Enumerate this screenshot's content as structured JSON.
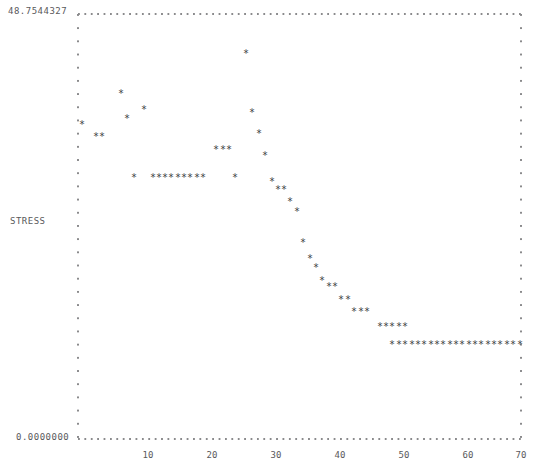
{
  "chart_data": {
    "type": "scatter",
    "title": "",
    "xlabel": "",
    "ylabel": "STRESS",
    "marker": "*",
    "grid": false,
    "legend": null,
    "xlim": [
      0,
      70
    ],
    "ylim": [
      0.0,
      48.7544327
    ],
    "y_axis_top_label": "48.7544327",
    "y_axis_bottom_label": "0.0000000",
    "x_tick_labels": [
      "10",
      "20",
      "30",
      "40",
      "50",
      "60",
      "70"
    ],
    "x_tick_values": [
      10,
      20,
      30,
      40,
      50,
      60,
      70
    ],
    "x": [
      1,
      3,
      4,
      7,
      8,
      10,
      11,
      13,
      14,
      15,
      16,
      17,
      18,
      19,
      20,
      21,
      22,
      23,
      24,
      25,
      26,
      27,
      28,
      29,
      30,
      31,
      32,
      33,
      34,
      35,
      36,
      37,
      38,
      39,
      40,
      41,
      42,
      43,
      44,
      45,
      46,
      47,
      48,
      49,
      50,
      51,
      52,
      53,
      54,
      55,
      56,
      57,
      58,
      59,
      60,
      61,
      62,
      63,
      64,
      65,
      66,
      67,
      68,
      69,
      70
    ],
    "y": [
      33.5,
      31.0,
      31.0,
      38.5,
      34.5,
      28.0,
      25.5,
      25.5,
      25.5,
      25.5,
      25.5,
      25.5,
      25.5,
      25.5,
      25.5,
      25.5,
      29.0,
      29.0,
      29.0,
      44.5,
      36.0,
      31.5,
      25.5,
      27.5,
      24.5,
      23.5,
      22.0,
      19.5,
      17.0,
      15.5,
      14.0,
      14.0,
      12.0,
      12.0,
      10.5,
      10.5,
      10.5,
      9.0,
      9.0,
      9.0,
      7.5,
      7.5,
      7.5,
      7.5,
      7.5,
      6.0,
      6.0,
      6.0,
      6.0,
      6.0,
      6.0,
      6.0,
      6.0,
      6.0,
      6.0,
      6.0,
      6.0,
      6.0,
      6.0,
      6.0,
      6.0,
      6.0,
      6.0,
      6.0,
      6.0
    ],
    "px": [
      {
        "x": 82,
        "y": 125
      },
      {
        "x": 96,
        "y": 137
      },
      {
        "x": 102,
        "y": 137
      },
      {
        "x": 121,
        "y": 94
      },
      {
        "x": 127,
        "y": 119
      },
      {
        "x": 134,
        "y": 178
      },
      {
        "x": 144,
        "y": 110
      },
      {
        "x": 153,
        "y": 178
      },
      {
        "x": 159,
        "y": 178
      },
      {
        "x": 165,
        "y": 178
      },
      {
        "x": 171,
        "y": 178
      },
      {
        "x": 178,
        "y": 178
      },
      {
        "x": 184,
        "y": 178
      },
      {
        "x": 190,
        "y": 178
      },
      {
        "x": 197,
        "y": 178
      },
      {
        "x": 203,
        "y": 178
      },
      {
        "x": 216,
        "y": 150
      },
      {
        "x": 223,
        "y": 150
      },
      {
        "x": 229,
        "y": 150
      },
      {
        "x": 246,
        "y": 54
      },
      {
        "x": 252,
        "y": 113
      },
      {
        "x": 259,
        "y": 134
      },
      {
        "x": 235,
        "y": 178
      },
      {
        "x": 265,
        "y": 156
      },
      {
        "x": 272,
        "y": 182
      },
      {
        "x": 278,
        "y": 190
      },
      {
        "x": 284,
        "y": 190
      },
      {
        "x": 290,
        "y": 202
      },
      {
        "x": 297,
        "y": 212
      },
      {
        "x": 303,
        "y": 243
      },
      {
        "x": 310,
        "y": 259
      },
      {
        "x": 316,
        "y": 268
      },
      {
        "x": 322,
        "y": 281
      },
      {
        "x": 329,
        "y": 287
      },
      {
        "x": 335,
        "y": 287
      },
      {
        "x": 341,
        "y": 300
      },
      {
        "x": 348,
        "y": 300
      },
      {
        "x": 354,
        "y": 312
      },
      {
        "x": 361,
        "y": 312
      },
      {
        "x": 367,
        "y": 312
      },
      {
        "x": 380,
        "y": 327
      },
      {
        "x": 386,
        "y": 327
      },
      {
        "x": 392,
        "y": 327
      },
      {
        "x": 399,
        "y": 327
      },
      {
        "x": 405,
        "y": 327
      },
      {
        "x": 392,
        "y": 345
      },
      {
        "x": 399,
        "y": 345
      },
      {
        "x": 405,
        "y": 345
      },
      {
        "x": 412,
        "y": 345
      },
      {
        "x": 418,
        "y": 345
      },
      {
        "x": 424,
        "y": 345
      },
      {
        "x": 431,
        "y": 345
      },
      {
        "x": 437,
        "y": 345
      },
      {
        "x": 443,
        "y": 345
      },
      {
        "x": 450,
        "y": 345
      },
      {
        "x": 456,
        "y": 345
      },
      {
        "x": 462,
        "y": 345
      },
      {
        "x": 469,
        "y": 345
      },
      {
        "x": 475,
        "y": 345
      },
      {
        "x": 481,
        "y": 345
      },
      {
        "x": 488,
        "y": 345
      },
      {
        "x": 494,
        "y": 345
      },
      {
        "x": 500,
        "y": 345
      },
      {
        "x": 507,
        "y": 345
      },
      {
        "x": 513,
        "y": 345
      },
      {
        "x": 520,
        "y": 345
      }
    ]
  },
  "axes": {
    "plot_left_px": 78,
    "plot_right_px": 521,
    "plot_top_px": 13,
    "plot_bottom_px": 438,
    "x_tick_px": [
      148,
      212,
      276,
      340,
      404,
      468,
      521
    ]
  }
}
